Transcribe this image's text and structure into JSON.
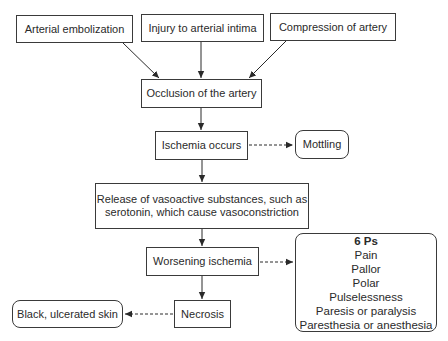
{
  "diagram": {
    "type": "flowchart",
    "nodes": {
      "arterial_embolization": "Arterial embolization",
      "injury_intima": "Injury to arterial intima",
      "compression": "Compression of artery",
      "occlusion": "Occlusion of the artery",
      "ischemia": "Ischemia occurs",
      "mottling": "Mottling",
      "release_line1": "Release of vasoactive substances, such as",
      "release_line2": "serotonin, which cause vasoconstriction",
      "worsening": "Worsening ischemia",
      "necrosis": "Necrosis",
      "black_skin": "Black, ulcerated skin"
    },
    "six_ps": {
      "title": "6 Ps",
      "items": [
        "Pain",
        "Pallor",
        "Polar",
        "Pulselessness",
        "Paresis or paralysis",
        "Paresthesia or anesthesia"
      ]
    },
    "edges": [
      {
        "from": "Arterial embolization",
        "to": "Occlusion of the artery",
        "style": "solid"
      },
      {
        "from": "Injury to arterial intima",
        "to": "Occlusion of the artery",
        "style": "solid"
      },
      {
        "from": "Compression of artery",
        "to": "Occlusion of the artery",
        "style": "solid"
      },
      {
        "from": "Occlusion of the artery",
        "to": "Ischemia occurs",
        "style": "solid"
      },
      {
        "from": "Ischemia occurs",
        "to": "Mottling",
        "style": "dashed"
      },
      {
        "from": "Ischemia occurs",
        "to": "Release of vasoactive substances",
        "style": "solid"
      },
      {
        "from": "Release of vasoactive substances",
        "to": "Worsening ischemia",
        "style": "solid"
      },
      {
        "from": "Worsening ischemia",
        "to": "6 Ps",
        "style": "dashed"
      },
      {
        "from": "Worsening ischemia",
        "to": "Necrosis",
        "style": "solid"
      },
      {
        "from": "Necrosis",
        "to": "Black, ulcerated skin",
        "style": "dashed"
      }
    ]
  }
}
